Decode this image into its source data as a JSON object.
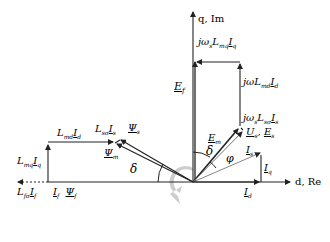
{
  "diagram": {
    "type": "phasor-diagram",
    "axes": {
      "q_axis_label": "q, Im",
      "d_axis_label": "d, Re"
    },
    "labels": {
      "jw_Lmq_Iq": {
        "main": "jω",
        "s1": "s",
        "m2": "L",
        "s2": "mq",
        "m3": "I",
        "s3": "q"
      },
      "jw_Lmd_Id": {
        "main": "jω",
        "s1": "s",
        "m2": "L",
        "s2": "md",
        "m3": "I",
        "s3": "d"
      },
      "jw_Lss_Is": {
        "main": "jω",
        "s1": "s",
        "m2": "L",
        "s2": "sσ",
        "m3": "I",
        "s3": "s"
      },
      "Ef": {
        "main": "E",
        "sub": "f"
      },
      "Em": {
        "main": "E",
        "sub": "m"
      },
      "Us_Es": {
        "m1": "U",
        "s1": "s",
        "sep": ", ",
        "m2": "E",
        "s2": "s"
      },
      "Is": {
        "main": "I",
        "sub": "s"
      },
      "Iq": {
        "main": "I",
        "sub": "q"
      },
      "Id": {
        "main": "I",
        "sub": "d"
      },
      "delta_upper": "δ",
      "delta_lower": "δ",
      "phi": "φ",
      "Psi_s": {
        "main": "Ψ",
        "sub": "s"
      },
      "Psi_m": {
        "main": "Ψ",
        "sub": "m"
      },
      "Lmd_Id": {
        "m1": "L",
        "s1": "md",
        "m2": "I",
        "s2": "d"
      },
      "Lss_Is": {
        "m1": "L",
        "s1": "sσ",
        "m2": "I",
        "s2": "s"
      },
      "Lmq_Iq": {
        "m1": "L",
        "s1": "mq",
        "m2": "I",
        "s2": "q"
      },
      "Lfs_If": {
        "m1": "L",
        "s1": "fσ",
        "m2": "I",
        "s2": "f"
      },
      "If_Psif": {
        "m1": "I",
        "s1": "f",
        "m2": "Ψ",
        "s2": "f"
      }
    },
    "colors": {
      "line": "#222222",
      "thin_line": "#555555",
      "rotation_arrow": "#c8c8c8"
    }
  }
}
